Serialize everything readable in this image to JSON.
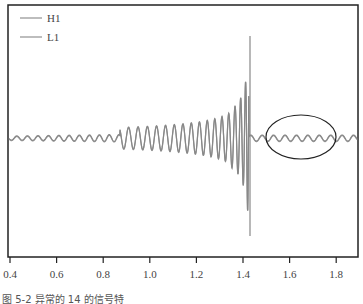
{
  "chart_data": {
    "type": "line",
    "title": "",
    "xlabel": "",
    "ylabel": "",
    "x_ticks": [
      "0.4",
      "0.6",
      "0.8",
      "1.0",
      "1.2",
      "1.4",
      "1.6",
      "1.8"
    ],
    "xlim": [
      0.39,
      1.9
    ],
    "legend": [
      "H1",
      "L1"
    ],
    "legend_position": "upper left",
    "grid": false,
    "series": [
      {
        "name": "H1",
        "description": "chirp waveform, amplitude increasing to peak near x=1.43 then small ringdown"
      },
      {
        "name": "L1",
        "description": "chirp waveform overlapping H1"
      }
    ],
    "annotations": [
      "ellipse around post-merger ringdown region x≈1.45–1.75"
    ],
    "colors": {
      "H1": "#888888",
      "L1": "#999999",
      "frame": "#222222"
    }
  },
  "caption": "图 5-2  异常的 14 的信号特"
}
